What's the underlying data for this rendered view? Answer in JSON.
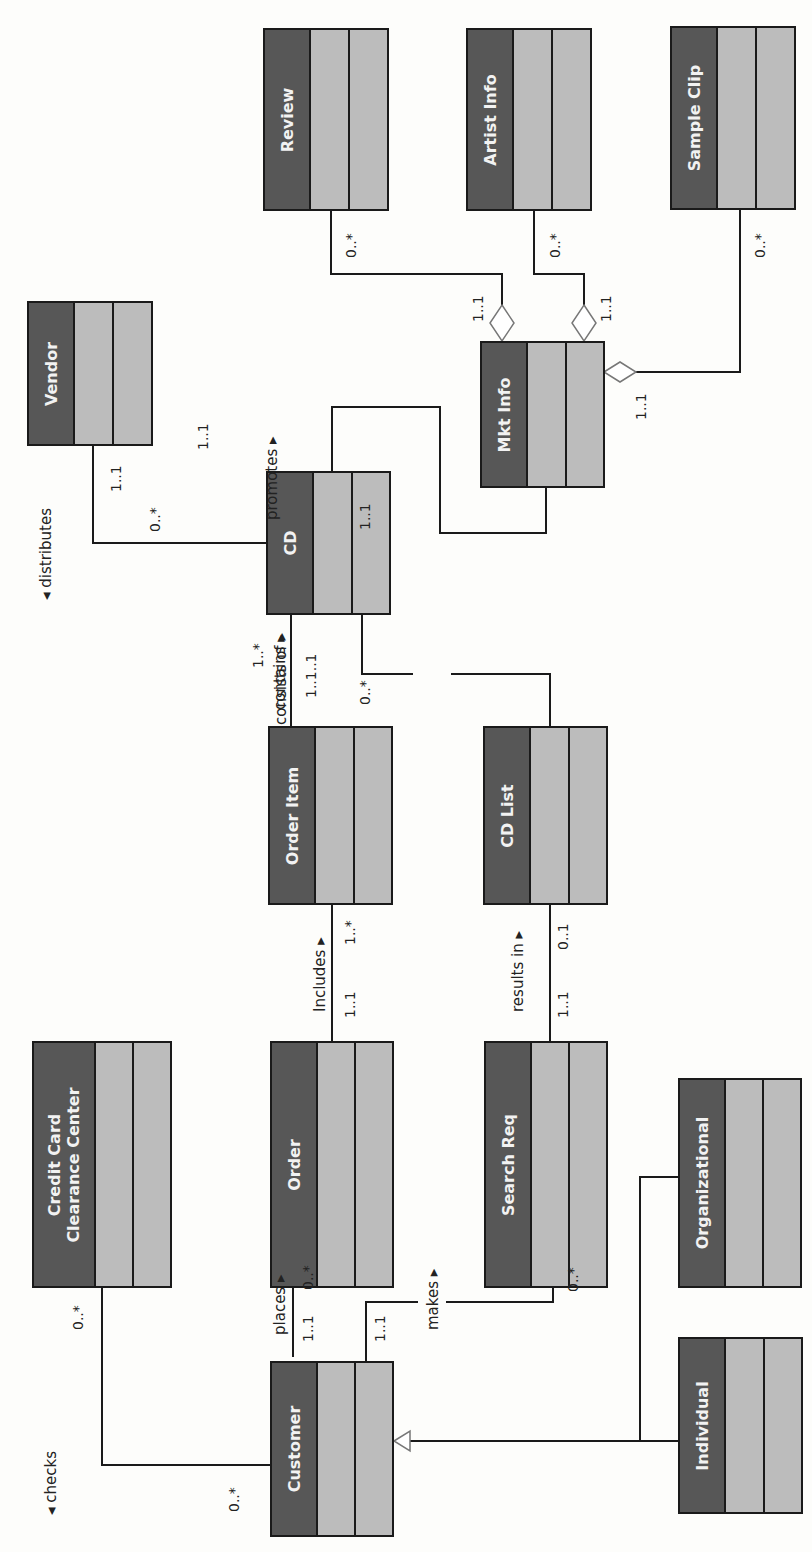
{
  "diagram": {
    "type": "UML class diagram",
    "orientation": "rotated 90° counter-clockwise",
    "colors": {
      "class_name_fill": "#575757",
      "compartment_fill": "#bcbcbc",
      "line": "#1a1a1a",
      "name_text": "#f2f2f2"
    },
    "classes": {
      "review": "Review",
      "artist_info": "Artist Info",
      "sample_clip": "Sample Clip",
      "vendor": "Vendor",
      "mkt_info": "Mkt Info",
      "cd": "CD",
      "order_item": "Order Item",
      "cd_list": "CD List",
      "credit_card_line1": "Credit Card",
      "credit_card_line2": "Clearance Center",
      "order": "Order",
      "search_req": "Search Req",
      "organizational": "Organizational",
      "customer": "Customer",
      "individual": "Individual"
    },
    "associations": {
      "distributes": {
        "label": "◂ distributes",
        "vendor_mult": "1..1",
        "cd_mult": "0..*"
      },
      "promotes": {
        "label": "promotes ▸",
        "cd_mult": "1..1",
        "mkt_mult": "1..1"
      },
      "review_agg": {
        "mkt_mult": "1..1",
        "review_mult": "0..*"
      },
      "artist_agg": {
        "mkt_mult": "1..1",
        "artist_mult": "0..*"
      },
      "clip_agg": {
        "mkt_mult": "1..1",
        "clip_mult": "0..*"
      },
      "contains": {
        "label": "contains ▸",
        "mult": "1..1..1"
      },
      "consists_of": {
        "label": "consists of ▸",
        "cd_mult": "1..*",
        "list_mult": "0..*"
      },
      "includes": {
        "label": "Includes ▸",
        "order_mult": "1..1",
        "item_mult": "1..*"
      },
      "results_in": {
        "label": "results in ▸",
        "req_mult": "1..1",
        "list_mult": "0..1"
      },
      "places": {
        "label": "places ▸",
        "cust_mult": "1..1",
        "order_mult": "0..*"
      },
      "makes": {
        "label": "makes ▸",
        "cust_mult": "1..1",
        "req_mult": "0..*"
      },
      "checks": {
        "label": "◂ checks",
        "cc_mult": "0..*",
        "cust_mult": "0..*"
      }
    }
  }
}
